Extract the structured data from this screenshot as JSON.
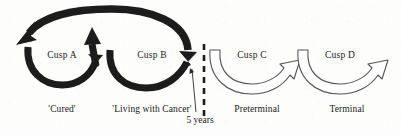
{
  "figure": {
    "width": 401,
    "height": 135,
    "background_color": "#fdfdfc",
    "black_arrow_color": "#1c1c1c",
    "white_arrow_fill": "#ffffff",
    "white_arrow_stroke": "#555555",
    "text_color": "#1a1a1a"
  },
  "cusps": [
    {
      "id": "a",
      "label": "Cusp A",
      "x": 62,
      "y": 56,
      "style": "filled"
    },
    {
      "id": "b",
      "label": "Cusp B",
      "x": 152,
      "y": 56,
      "style": "filled"
    },
    {
      "id": "c",
      "label": "Cusp C",
      "x": 252,
      "y": 56,
      "style": "outline"
    },
    {
      "id": "d",
      "label": "Cusp D",
      "x": 340,
      "y": 56,
      "style": "outline"
    }
  ],
  "phases": [
    {
      "id": "cured",
      "label": "'Cured'",
      "x": 62,
      "y": 110
    },
    {
      "id": "living",
      "label": "'Living with Cancer'",
      "x": 152,
      "y": 110
    },
    {
      "id": "preterm",
      "label": "Preterminal",
      "x": 257,
      "y": 110
    },
    {
      "id": "terminal",
      "label": "Terminal",
      "x": 347,
      "y": 110
    }
  ],
  "divider": {
    "id": "five-year-divider",
    "label": "5 years",
    "label_x": 200,
    "label_y": 120,
    "line_x": 204,
    "line_top": 44,
    "line_bottom": 118,
    "dash_color": "#1c1c1c"
  }
}
